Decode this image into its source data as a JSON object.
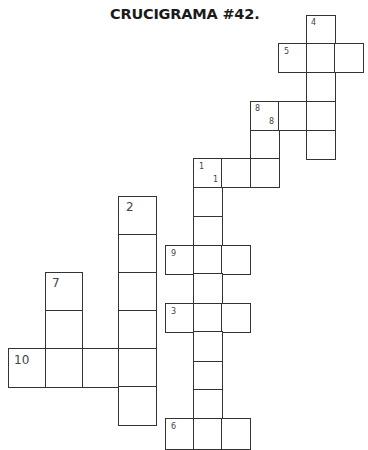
{
  "title": "CRUCIGRAMA #42.",
  "colors": {
    "line": "#333333",
    "number": "#444444",
    "background": "#ffffff",
    "title": "#1a1a1a"
  },
  "clues": {
    "n1": "1",
    "n1b": "1",
    "n2": "2",
    "n3": "3",
    "n4": "4",
    "n5": "5",
    "n6": "6",
    "n7": "7",
    "n8": "8",
    "n8b": "8",
    "n9": "9",
    "n10": "10"
  },
  "words": [
    {
      "number": "1",
      "direction": "across",
      "length": 3
    },
    {
      "number": "1",
      "direction": "down",
      "length": 10
    },
    {
      "number": "2",
      "direction": "down",
      "length": 6
    },
    {
      "number": "3",
      "direction": "across",
      "length": 3
    },
    {
      "number": "4",
      "direction": "down",
      "length": 5
    },
    {
      "number": "5",
      "direction": "across",
      "length": 3
    },
    {
      "number": "6",
      "direction": "across",
      "length": 3
    },
    {
      "number": "7",
      "direction": "down",
      "length": 3
    },
    {
      "number": "8",
      "direction": "across",
      "length": 3
    },
    {
      "number": "8",
      "direction": "down",
      "length": 3
    },
    {
      "number": "9",
      "direction": "across",
      "length": 3
    },
    {
      "number": "10",
      "direction": "across",
      "length": 4
    }
  ]
}
